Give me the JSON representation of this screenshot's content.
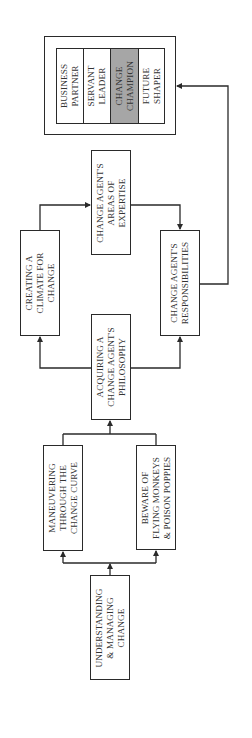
{
  "diagram": {
    "orientation": "rotated-90-counterclockwise",
    "nodes": {
      "understanding": {
        "line1": "UNDERSTANDING",
        "line2": "& MANAGING",
        "line3": "CHANGE"
      },
      "maneuvering": {
        "line1": "MANEUVERING",
        "line2": "THROUGH THE",
        "line3": "CHANGE CURVE"
      },
      "beware": {
        "line1": "BEWARE OF",
        "line2": "FLYING MONKEYS",
        "line3": "& POISON POPPIES"
      },
      "acquiring": {
        "line1": "ACQUIRING A",
        "line2": "CHANGE AGENT'S",
        "line3": "PHILOSOPHY"
      },
      "climate": {
        "line1": "CREATING A",
        "line2": "CLIMATE FOR",
        "line3": "CHANGE"
      },
      "responsibilities": {
        "line1": "CHANGE AGENT'S",
        "line2": "RESPONSIBILITIES"
      },
      "expertise": {
        "line1": "CHANGE AGENT'S",
        "line2": "AREAS OF",
        "line3": "EXPERTISE"
      }
    },
    "roles": [
      {
        "line1": "BUSINESS",
        "line2": "PARTNER",
        "highlight": false
      },
      {
        "line1": "SERVANT",
        "line2": "LEADER",
        "highlight": false
      },
      {
        "line1": "CHANGE",
        "line2": "CHAMPION",
        "highlight": true
      },
      {
        "line1": "FUTURE",
        "line2": "SHAPER",
        "highlight": false
      }
    ],
    "colors": {
      "line": "#2a2a2a",
      "highlight": "#a6a6a6",
      "text": "#333333",
      "background": "#ffffff"
    }
  }
}
